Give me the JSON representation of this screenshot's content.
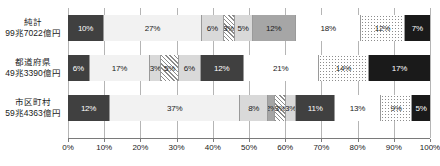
{
  "chart_data": {
    "type": "bar",
    "orientation": "horizontal",
    "stacked": "100%",
    "title": "",
    "xlabel": "",
    "ylabel": "",
    "xlim": [
      0,
      100
    ],
    "grid": true,
    "legend_position": "none",
    "xticks": [
      "0%",
      "10%",
      "20%",
      "30%",
      "40%",
      "50%",
      "60%",
      "70%",
      "80%",
      "90%",
      "100%"
    ],
    "xtick_values": [
      0,
      10,
      20,
      30,
      40,
      50,
      60,
      70,
      80,
      90,
      100
    ],
    "categories": [
      {
        "line1": "純計",
        "line2": "99兼7022億円"
      },
      {
        "line1": "都道府県",
        "line2": "49兇7022億円"
      },
      {
        "line1": "市区町村",
        "line2": "59兇4363億円"
      }
    ],
    "series_fills": [
      "dark",
      "lightest",
      "light",
      "hatch",
      "light",
      "mid",
      "white",
      "dots",
      "black"
    ],
    "rows": [
      {
        "name": "純計",
        "amount": "99兆7022億円",
        "segments": [
          {
            "value": 10,
            "label": "10%",
            "fill": "dark"
          },
          {
            "value": 27,
            "label": "27%",
            "fill": "lightest"
          },
          {
            "value": 6,
            "label": "6%",
            "fill": "light"
          },
          {
            "value": 3,
            "label": "3%",
            "fill": "hatch"
          },
          {
            "value": 5,
            "label": "5%",
            "fill": "light"
          },
          {
            "value": 12,
            "label": "12%",
            "fill": "mid"
          },
          {
            "value": 18,
            "label": "18%",
            "fill": "white"
          },
          {
            "value": 12,
            "label": "12%",
            "fill": "dots"
          },
          {
            "value": 7,
            "label": "7%",
            "fill": "black"
          }
        ]
      },
      {
        "name": "都道府県",
        "amount": "49兆3390億円",
        "segments": [
          {
            "value": 6,
            "label": "6%",
            "fill": "dark"
          },
          {
            "value": 17,
            "label": "17%",
            "fill": "lightest"
          },
          {
            "value": 3,
            "label": "3%",
            "fill": "light"
          },
          {
            "value": 5,
            "label": "5%",
            "fill": "hatch"
          },
          {
            "value": 6,
            "label": "6%",
            "fill": "light"
          },
          {
            "value": 12,
            "label": "12%",
            "fill": "dark"
          },
          {
            "value": 21,
            "label": "21%",
            "fill": "white"
          },
          {
            "value": 14,
            "label": "14%",
            "fill": "dots"
          },
          {
            "value": 17,
            "label": "17%",
            "fill": "black"
          }
        ]
      },
      {
        "name": "市区町村",
        "amount": "59兆4363億円",
        "segments": [
          {
            "value": 12,
            "label": "12%",
            "fill": "dark"
          },
          {
            "value": 37,
            "label": "37%",
            "fill": "lightest"
          },
          {
            "value": 8,
            "label": "8%",
            "fill": "light"
          },
          {
            "value": 2,
            "label": "2%",
            "fill": "mid"
          },
          {
            "value": 3,
            "label": "3%",
            "fill": "hatch"
          },
          {
            "value": 3,
            "label": "3%",
            "fill": "light"
          },
          {
            "value": 11,
            "label": "11%",
            "fill": "dark"
          },
          {
            "value": 13,
            "label": "13%",
            "fill": "white"
          },
          {
            "value": 9,
            "label": "9%",
            "fill": "dots"
          },
          {
            "value": 5,
            "label": "5%",
            "fill": "black"
          }
        ]
      }
    ]
  }
}
